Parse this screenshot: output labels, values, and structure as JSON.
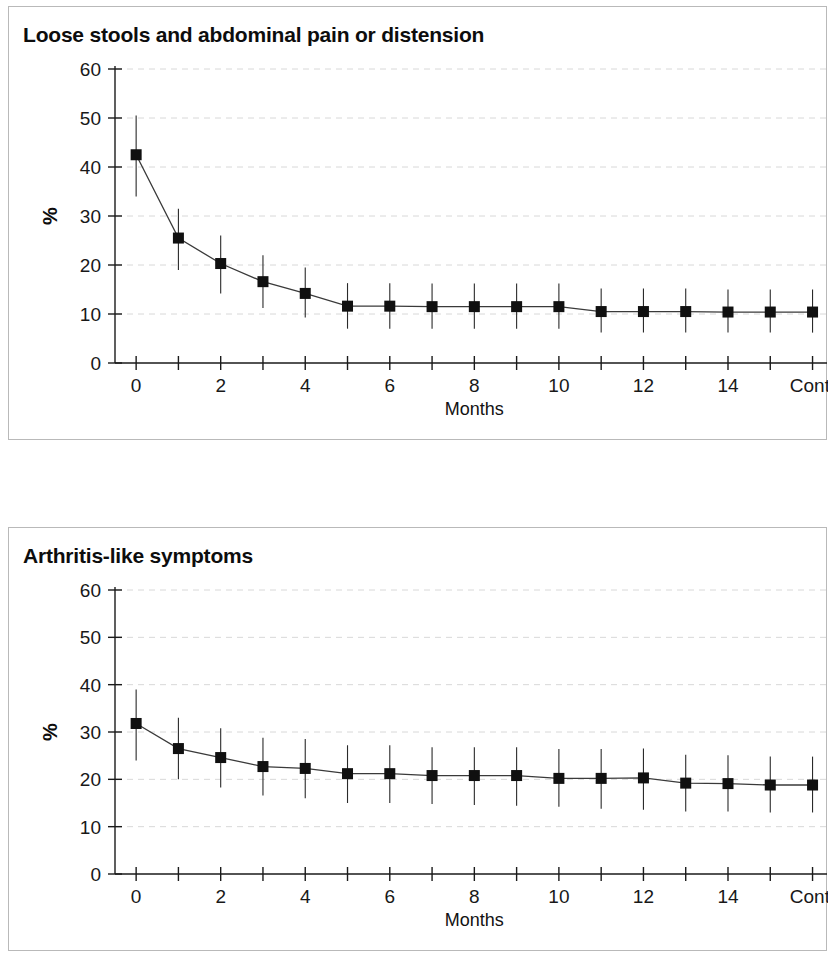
{
  "figure": {
    "background": "#ffffff",
    "panel_border_color": "#b9b9b9",
    "ink_color": "#1a1a1a",
    "gridline_color": "#d8d8d8",
    "marker_color": "#101010"
  },
  "panels": [
    {
      "id": "panel-1",
      "title": "Loose stools and abdominal pain or distension"
    },
    {
      "id": "panel-2",
      "title": "Arthritis-like symptoms"
    }
  ],
  "chart_data": [
    {
      "type": "line",
      "title": "Loose stools and abdominal pain or distension",
      "xlabel": "Months",
      "ylabel": "%",
      "grid": true,
      "legend": null,
      "error_bars": "vertical, capless",
      "marker": "filled square",
      "xlim": [
        -0.5,
        16.2
      ],
      "ylim": [
        0,
        60
      ],
      "yticks": [
        0,
        10,
        20,
        30,
        40,
        50,
        60
      ],
      "ytick_labels": [
        "0",
        "10",
        "20",
        "30",
        "40",
        "50",
        "60"
      ],
      "xticks": [
        0,
        1,
        2,
        3,
        4,
        5,
        6,
        7,
        8,
        9,
        10,
        11,
        12,
        13,
        14,
        15,
        16
      ],
      "xtick_labels": [
        "0",
        "",
        "2",
        "",
        "4",
        "",
        "6",
        "",
        "8",
        "",
        "10",
        "",
        "12",
        "",
        "14",
        "",
        "Cont."
      ],
      "categories": [
        "0",
        "1",
        "2",
        "3",
        "4",
        "5",
        "6",
        "7",
        "8",
        "9",
        "10",
        "11",
        "12",
        "13",
        "14",
        "15",
        "Cont."
      ],
      "x": [
        0,
        1,
        2,
        3,
        4,
        5,
        6,
        7,
        8,
        9,
        10,
        11,
        12,
        13,
        14,
        15,
        16
      ],
      "values": [
        42.5,
        25.5,
        20.3,
        16.6,
        14.2,
        11.6,
        11.6,
        11.5,
        11.5,
        11.5,
        11.5,
        10.5,
        10.5,
        10.5,
        10.4,
        10.4,
        10.4
      ],
      "err_low": [
        34.0,
        19.0,
        14.2,
        11.2,
        9.3,
        7.0,
        7.0,
        7.0,
        7.0,
        7.0,
        7.0,
        6.2,
        6.2,
        6.2,
        6.2,
        6.2,
        6.2
      ],
      "err_high": [
        50.5,
        31.5,
        26.0,
        22.0,
        19.5,
        16.3,
        16.3,
        16.2,
        16.2,
        16.2,
        16.2,
        15.2,
        15.2,
        15.2,
        15.0,
        15.0,
        15.0
      ]
    },
    {
      "type": "line",
      "title": "Arthritis-like symptoms",
      "xlabel": "Months",
      "ylabel": "%",
      "grid": true,
      "legend": null,
      "error_bars": "vertical, capless",
      "marker": "filled square",
      "xlim": [
        -0.5,
        16.2
      ],
      "ylim": [
        0,
        60
      ],
      "yticks": [
        0,
        10,
        20,
        30,
        40,
        50,
        60
      ],
      "ytick_labels": [
        "0",
        "10",
        "20",
        "30",
        "40",
        "50",
        "60"
      ],
      "xticks": [
        0,
        1,
        2,
        3,
        4,
        5,
        6,
        7,
        8,
        9,
        10,
        11,
        12,
        13,
        14,
        15,
        16
      ],
      "xtick_labels": [
        "0",
        "",
        "2",
        "",
        "4",
        "",
        "6",
        "",
        "8",
        "",
        "10",
        "",
        "12",
        "",
        "14",
        "",
        "Cont."
      ],
      "categories": [
        "0",
        "1",
        "2",
        "3",
        "4",
        "5",
        "6",
        "7",
        "8",
        "9",
        "10",
        "11",
        "12",
        "13",
        "14",
        "15",
        "Cont."
      ],
      "x": [
        0,
        1,
        2,
        3,
        4,
        5,
        6,
        7,
        8,
        9,
        10,
        11,
        12,
        13,
        14,
        15,
        16
      ],
      "values": [
        31.8,
        26.5,
        24.6,
        22.7,
        22.3,
        21.2,
        21.2,
        20.8,
        20.8,
        20.8,
        20.2,
        20.2,
        20.3,
        19.2,
        19.1,
        18.8,
        18.8
      ],
      "err_low": [
        24.0,
        20.0,
        18.3,
        16.6,
        16.0,
        15.0,
        15.0,
        14.8,
        14.6,
        14.4,
        14.2,
        13.8,
        13.6,
        13.2,
        13.2,
        13.0,
        13.0
      ],
      "err_high": [
        39.0,
        33.0,
        30.8,
        28.8,
        28.5,
        27.2,
        27.2,
        26.8,
        26.8,
        26.8,
        26.4,
        26.4,
        26.5,
        25.2,
        25.1,
        24.8,
        24.8
      ]
    }
  ]
}
